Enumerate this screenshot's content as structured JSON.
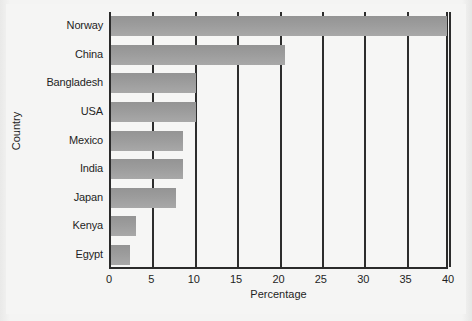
{
  "chart_data": {
    "type": "bar",
    "orientation": "horizontal",
    "title": "",
    "xlabel": "Percentage",
    "ylabel": "Country",
    "categories": [
      "Norway",
      "China",
      "Bangladesh",
      "USA",
      "Mexico",
      "India",
      "Japan",
      "Kenya",
      "Egypt"
    ],
    "values": [
      39.6,
      20.5,
      10.0,
      10.0,
      8.5,
      8.5,
      7.7,
      3.0,
      2.2
    ],
    "xlim": [
      0,
      40
    ],
    "xticks": [
      0,
      5,
      10,
      15,
      20,
      25,
      30,
      35,
      40
    ],
    "xtick_labels": [
      "0",
      "5",
      "10",
      "15",
      "20",
      "25",
      "30",
      "35",
      "40"
    ],
    "grid": "vertical",
    "legend": "none",
    "bar_color": "#9c9c9c",
    "axis_color": "#2b2b2b",
    "plot_background": "#f6f6f5",
    "page_background": "#f3f3f2"
  }
}
